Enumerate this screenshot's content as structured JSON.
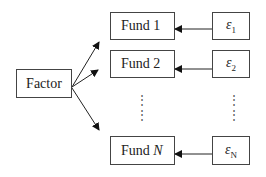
{
  "diagram": {
    "factor": {
      "label": "Factor"
    },
    "funds": [
      {
        "name": "Fund 1",
        "prefix": "Fund ",
        "index": "1",
        "epsilon": "ε",
        "epsilon_sub": "1"
      },
      {
        "name": "Fund 2",
        "prefix": "Fund ",
        "index": "2",
        "epsilon": "ε",
        "epsilon_sub": "2"
      },
      {
        "name": "Fund N",
        "prefix": "Fund ",
        "index": "N",
        "epsilon": "ε",
        "epsilon_sub": "N"
      }
    ],
    "ellipsis": "⋮",
    "edges": [
      {
        "from": "Factor",
        "to": "Fund 1"
      },
      {
        "from": "Factor",
        "to": "Fund 2"
      },
      {
        "from": "Factor",
        "to": "Fund N"
      },
      {
        "from": "ε1",
        "to": "Fund 1"
      },
      {
        "from": "ε2",
        "to": "Fund 2"
      },
      {
        "from": "εN",
        "to": "Fund N"
      }
    ]
  }
}
